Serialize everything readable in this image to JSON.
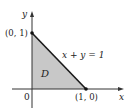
{
  "diagram": {
    "axes": {
      "x_label": "x",
      "y_label": "y",
      "origin_label": "0"
    },
    "points": [
      {
        "label": "(0, 1)",
        "x": 0,
        "y": 1
      },
      {
        "label": "(1, 0)",
        "x": 1,
        "y": 0
      }
    ],
    "line_label": "x + y = 1",
    "region_label": "D",
    "colors": {
      "region_fill": "#c8c8c8",
      "axis": "#333333",
      "hypotenuse": "#1a1a1a"
    }
  }
}
